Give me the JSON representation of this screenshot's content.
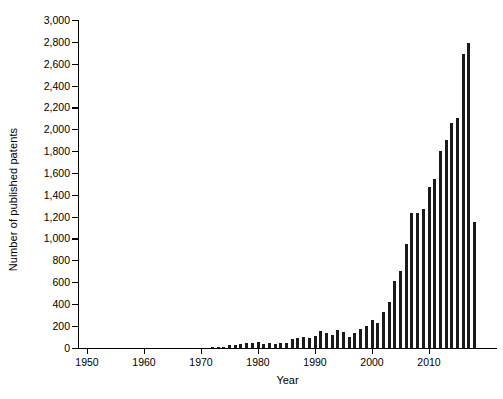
{
  "chart_data": {
    "type": "bar",
    "title": "",
    "xlabel": "Year",
    "ylabel": "Number of published patents",
    "xlim": [
      1947,
      2019
    ],
    "ylim": [
      0,
      3000
    ],
    "ytick_values": [
      0,
      200,
      400,
      600,
      800,
      1000,
      1200,
      1400,
      1600,
      1800,
      2000,
      2200,
      2400,
      2600,
      2800,
      3000
    ],
    "ytick_labels": [
      "0",
      "200",
      "400",
      "600",
      "800",
      "1,000",
      "1,200",
      "1,400",
      "1,600",
      "1,800",
      "2,000",
      "2,200",
      "2,400",
      "2,600",
      "2,800",
      "3,000"
    ],
    "xtick_values": [
      1950,
      1960,
      1970,
      1980,
      1990,
      2000,
      2010
    ],
    "xtick_labels": [
      "1950",
      "1960",
      "1970",
      "1980",
      "1990",
      "2000",
      "2010"
    ],
    "grid": false,
    "legend": false,
    "bar_color": "#1a1a1a",
    "categories": [
      1948,
      1949,
      1950,
      1951,
      1952,
      1953,
      1954,
      1955,
      1956,
      1957,
      1958,
      1959,
      1960,
      1961,
      1962,
      1963,
      1964,
      1965,
      1966,
      1967,
      1968,
      1969,
      1970,
      1971,
      1972,
      1973,
      1974,
      1975,
      1976,
      1977,
      1978,
      1979,
      1980,
      1981,
      1982,
      1983,
      1984,
      1985,
      1986,
      1987,
      1988,
      1989,
      1990,
      1991,
      1992,
      1993,
      1994,
      1995,
      1996,
      1997,
      1998,
      1999,
      2000,
      2001,
      2002,
      2003,
      2004,
      2005,
      2006,
      2007,
      2008,
      2009,
      2010,
      2011,
      2012,
      2013,
      2014,
      2015,
      2016,
      2017,
      2018
    ],
    "values": [
      0,
      0,
      0,
      0,
      0,
      0,
      0,
      0,
      0,
      0,
      0,
      0,
      0,
      0,
      0,
      0,
      0,
      0,
      0,
      0,
      0,
      0,
      0,
      0,
      5,
      8,
      10,
      25,
      20,
      30,
      45,
      40,
      55,
      35,
      40,
      35,
      45,
      40,
      80,
      90,
      95,
      90,
      105,
      150,
      130,
      120,
      160,
      140,
      100,
      130,
      170,
      200,
      250,
      230,
      330,
      420,
      610,
      700,
      950,
      1230,
      1230,
      1270,
      1470,
      1540,
      1800,
      1900,
      2060,
      2100,
      2690,
      2790,
      1150
    ]
  }
}
